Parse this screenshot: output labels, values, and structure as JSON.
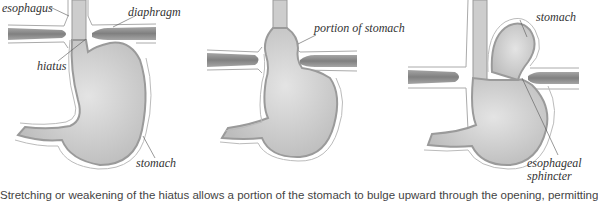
{
  "figure": {
    "topic": "hiatal hernia",
    "panels": [
      {
        "id": "normal",
        "labels": {
          "esophagus": "esophagus",
          "diaphragm": "diaphragm",
          "hiatus": "hiatus",
          "stomach": "stomach"
        }
      },
      {
        "id": "sliding",
        "labels": {
          "portion": "portion of stomach"
        }
      },
      {
        "id": "paraesophageal",
        "labels": {
          "stomach": "stomach",
          "sphincter_line1": "esophageal",
          "sphincter_line2": "sphincter"
        }
      }
    ],
    "caption": "Stretching or weakening of the hiatus allows a portion of the stomach to bulge upward through the opening, permitting"
  },
  "colors": {
    "organ_fill": "#c8c8c8",
    "organ_light": "#dedede",
    "outline": "#9a9a9a",
    "diaphragm": "#8f8f8f",
    "text": "#333333"
  }
}
